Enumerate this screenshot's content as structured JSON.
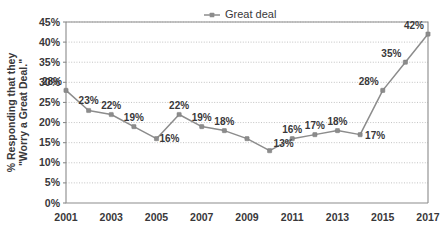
{
  "chart_data": {
    "type": "line",
    "title": "",
    "xlabel": "",
    "ylabel": "% Responding that they \"Worry a Great Deal.\"",
    "ylabel_line1": "% Responding that they",
    "ylabel_line2": "\"Worry a Great Deal.\"",
    "legend": {
      "position": "top-center",
      "entries": [
        "Great deal"
      ]
    },
    "series": [
      {
        "name": "Great deal",
        "color": "#8c8c8c",
        "x": [
          2001,
          2002,
          2003,
          2004,
          2005,
          2006,
          2007,
          2008,
          2009,
          2010,
          2011,
          2012,
          2013,
          2014,
          2015,
          2016,
          2017
        ],
        "values": [
          28,
          23,
          22,
          19,
          16,
          22,
          19,
          18,
          16,
          13,
          16,
          17,
          18,
          17,
          28,
          35,
          42
        ],
        "point_labels": [
          "28%",
          "23%",
          "22%",
          "19%",
          "16%",
          "22%",
          "19%",
          "18%",
          "",
          "13%",
          "16%",
          "17%",
          "18%",
          "17%",
          "28%",
          "35%",
          "42%"
        ],
        "label_positions": [
          "above-left",
          "above",
          "above",
          "above",
          "below-right",
          "above",
          "above",
          "above",
          "",
          "above-right",
          "above",
          "above",
          "above",
          "right",
          "above-left",
          "above-left",
          "above-left"
        ]
      }
    ],
    "xlim": [
      2001,
      2017
    ],
    "x_ticks": [
      2001,
      2002,
      2003,
      2004,
      2005,
      2006,
      2007,
      2008,
      2009,
      2010,
      2011,
      2012,
      2013,
      2014,
      2015,
      2016,
      2017
    ],
    "x_tick_labels": [
      "2001",
      "",
      "2003",
      "",
      "2005",
      "",
      "2007",
      "",
      "2009",
      "",
      "2011",
      "",
      "2013",
      "",
      "2015",
      "",
      "2017"
    ],
    "ylim": [
      0,
      45
    ],
    "y_ticks": [
      0,
      5,
      10,
      15,
      20,
      25,
      30,
      35,
      40,
      45
    ],
    "y_tick_labels": [
      "0%",
      "5%",
      "10%",
      "15%",
      "20%",
      "25%",
      "30%",
      "35%",
      "40%",
      "45%"
    ],
    "grid": true,
    "grid_style": "dotted-horizontal"
  },
  "colors": {
    "series": "#8c8c8c",
    "grid": "#a9a9a9",
    "axis": "#8b8b8b",
    "text": "#39383a",
    "background": "#ffffff"
  }
}
